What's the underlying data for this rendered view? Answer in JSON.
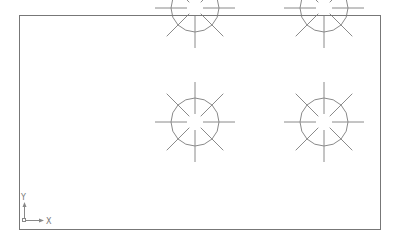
{
  "drawing": {
    "background": "#ffffff",
    "line_color": "#8a8a8a",
    "frame_color": "#777777",
    "frame": {
      "x": 19,
      "y": 15,
      "width": 361,
      "height": 214
    },
    "symbol": {
      "circle_radius": 24,
      "ray_length": 40,
      "ray_gap": 8,
      "circle_sides": 16
    },
    "symbols": [
      {
        "cx": 195,
        "cy": 8
      },
      {
        "cx": 324,
        "cy": 8
      },
      {
        "cx": 195,
        "cy": 122
      },
      {
        "cx": 324,
        "cy": 122
      }
    ]
  },
  "ucs_icon": {
    "x_label": "X",
    "y_label": "Y",
    "origin": {
      "x": 24,
      "y": 220
    }
  }
}
